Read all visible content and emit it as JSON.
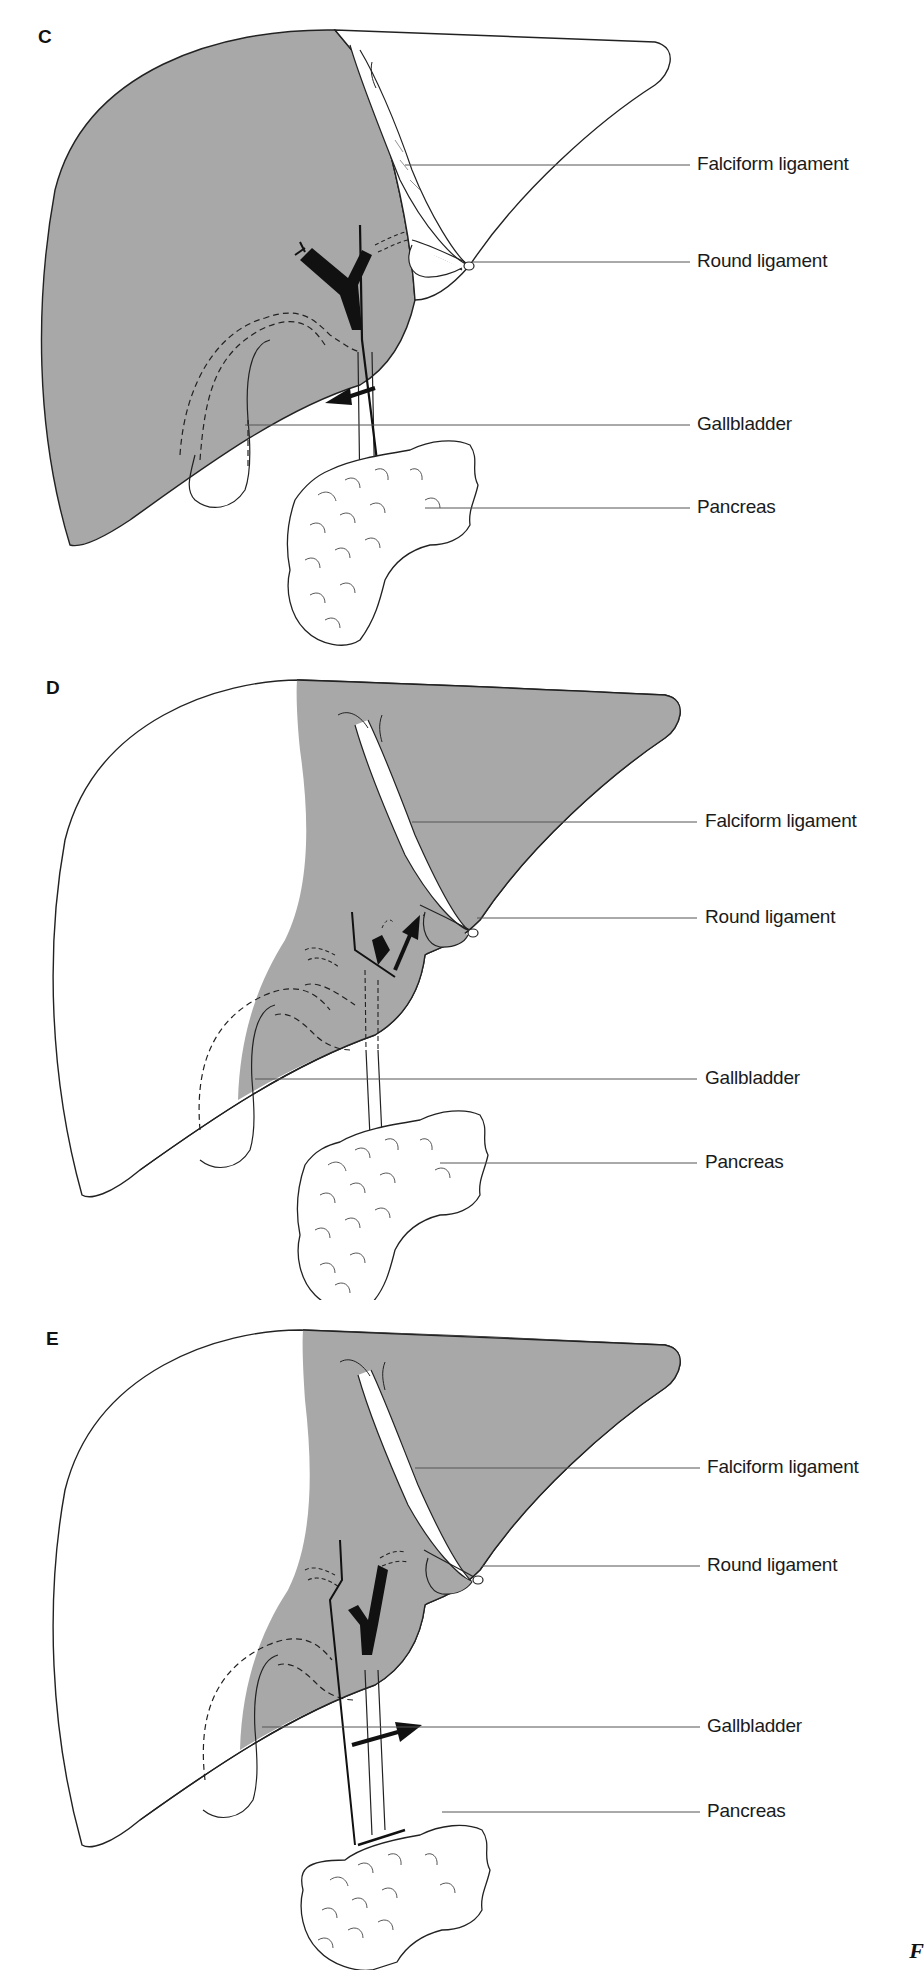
{
  "colors": {
    "liver_shade": "#a8a8a8",
    "outline": "#222222",
    "leader_line": "#555555",
    "background": "#ffffff"
  },
  "panels": [
    {
      "letter": "C",
      "labels": {
        "falciform": "Falciform ligament",
        "round": "Round ligament",
        "gallbladder": "Gallbladder",
        "pancreas": "Pancreas"
      },
      "shaded_region": "right lobe (full right side shaded)",
      "arrow_direction": "left-down"
    },
    {
      "letter": "D",
      "labels": {
        "falciform": "Falciform ligament",
        "round": "Round ligament",
        "gallbladder": "Gallbladder",
        "pancreas": "Pancreas"
      },
      "shaded_region": "left lobe and medial segment shaded",
      "arrow_direction": "up-right"
    },
    {
      "letter": "E",
      "labels": {
        "falciform": "Falciform ligament",
        "round": "Round ligament",
        "gallbladder": "Gallbladder",
        "pancreas": "Pancreas"
      },
      "shaded_region": "left lobe and medial segment shaded",
      "arrow_direction": "right"
    }
  ],
  "figure_corner_text": "F"
}
